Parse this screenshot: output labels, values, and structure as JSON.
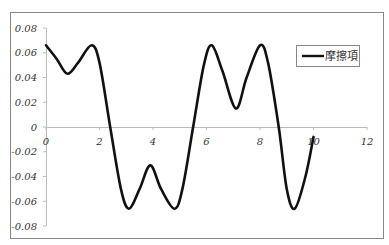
{
  "chart_data": {
    "type": "line",
    "title": "",
    "xlabel": "",
    "ylabel": "",
    "xlim": [
      0,
      12
    ],
    "ylim": [
      -0.08,
      0.08
    ],
    "x_ticks": [
      "0",
      "2",
      "4",
      "6",
      "8",
      "10",
      "12"
    ],
    "y_ticks": [
      "0.08",
      "0.06",
      "0.04",
      "0.02",
      "0",
      "-0.02",
      "-0.04",
      "-0.06",
      "-0.08"
    ],
    "grid": false,
    "legend_position": "upper right",
    "series": [
      {
        "name": "摩擦項",
        "color": "#111111",
        "x": [
          0,
          0.4,
          0.8,
          1.2,
          1.7,
          2.0,
          2.4,
          2.8,
          3.1,
          3.5,
          3.9,
          4.3,
          4.8,
          5.1,
          5.5,
          5.9,
          6.2,
          6.6,
          7.1,
          7.5,
          8.0,
          8.3,
          8.7,
          9.0,
          9.3,
          9.7,
          10.0
        ],
        "y": [
          0.066,
          0.055,
          0.043,
          0.052,
          0.066,
          0.052,
          0.0,
          -0.05,
          -0.066,
          -0.05,
          -0.031,
          -0.05,
          -0.066,
          -0.05,
          0.0,
          0.05,
          0.066,
          0.045,
          0.015,
          0.04,
          0.066,
          0.052,
          0.0,
          -0.05,
          -0.066,
          -0.04,
          -0.008
        ]
      }
    ]
  },
  "legend": {
    "label": "摩擦項"
  }
}
